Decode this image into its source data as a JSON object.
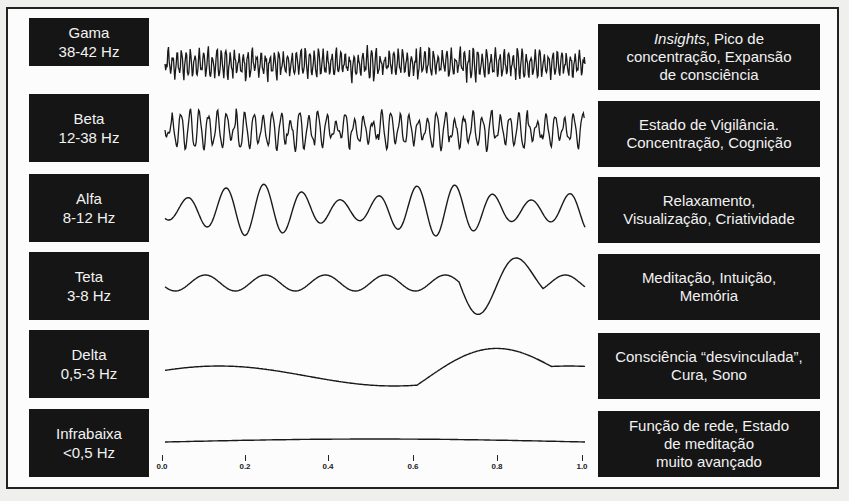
{
  "bands": [
    {
      "name": "Gama",
      "range": "38-42 Hz",
      "desc_lines": [
        {
          "italic": "Insights",
          "rest": ", Pico de"
        },
        {
          "text": "concentração, Expansão"
        },
        {
          "text": "de consciência"
        }
      ]
    },
    {
      "name": "Beta",
      "range": "12-38 Hz",
      "desc_lines": [
        {
          "text": "Estado de Vigilância."
        },
        {
          "text": "Concentração, Cognição"
        }
      ]
    },
    {
      "name": "Alfa",
      "range": "8-12 Hz",
      "desc_lines": [
        {
          "text": "Relaxamento,"
        },
        {
          "text": "Visualização, Criatividade"
        }
      ]
    },
    {
      "name": "Teta",
      "range": "3-8 Hz",
      "desc_lines": [
        {
          "text": "Meditação, Intuição,"
        },
        {
          "text": "Memória"
        }
      ]
    },
    {
      "name": "Delta",
      "range": "0,5-3 Hz",
      "desc_lines": [
        {
          "text": "Consciência “desvinculada”,"
        },
        {
          "text": "Cura, Sono"
        }
      ]
    },
    {
      "name": "Infrabaixa",
      "range": "<0,5 Hz",
      "desc_lines": [
        {
          "text": "Função de rede, Estado"
        },
        {
          "text": "de meditação"
        },
        {
          "text": "muito avançado"
        }
      ]
    }
  ],
  "axis": {
    "ticks": [
      "0.0",
      "0.2",
      "0.4",
      "0.6",
      "0.8",
      "1.0"
    ]
  },
  "colors": {
    "box_bg": "#151515",
    "box_text": "#f2f2f2",
    "wave": "#1a1a1a",
    "frame": "#222222",
    "background": "#fcfcfc"
  }
}
